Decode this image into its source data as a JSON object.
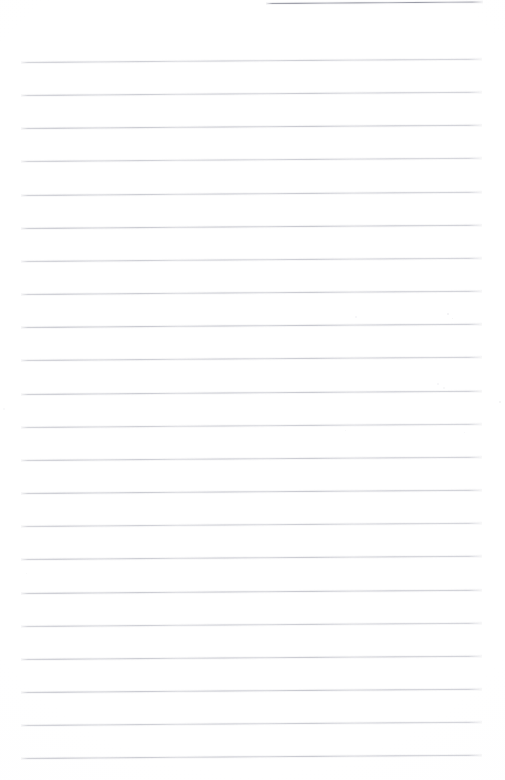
{
  "document": {
    "kind": "scanned-blank-ruled-paper",
    "page_label": "",
    "title": "",
    "body_text": "",
    "visible_text": "",
    "width_px": 505,
    "height_px": 780,
    "background_color": "#ffffff",
    "rule_color": "#babcc4",
    "top_fragment_color": "#8a8c98",
    "orientation": "portrait",
    "skew_degrees": -0.4
  },
  "ruling": {
    "line_count": 22,
    "spacing_px": 33.1,
    "first_line_y": 62,
    "left_margin_x": 21,
    "right_margin_x": 482,
    "line_thickness_px": 1,
    "lines": [
      {
        "y": 62,
        "x1": 21,
        "x2": 482
      },
      {
        "y": 95,
        "x1": 21,
        "x2": 482
      },
      {
        "y": 128,
        "x1": 21,
        "x2": 482
      },
      {
        "y": 161,
        "x1": 21,
        "x2": 482
      },
      {
        "y": 195,
        "x1": 21,
        "x2": 482
      },
      {
        "y": 228,
        "x1": 21,
        "x2": 482
      },
      {
        "y": 261,
        "x1": 21,
        "x2": 482
      },
      {
        "y": 294,
        "x1": 21,
        "x2": 482
      },
      {
        "y": 327,
        "x1": 21,
        "x2": 482
      },
      {
        "y": 360,
        "x1": 21,
        "x2": 482
      },
      {
        "y": 394,
        "x1": 21,
        "x2": 482
      },
      {
        "y": 427,
        "x1": 21,
        "x2": 482
      },
      {
        "y": 460,
        "x1": 21,
        "x2": 482
      },
      {
        "y": 493,
        "x1": 21,
        "x2": 482
      },
      {
        "y": 526,
        "x1": 21,
        "x2": 482
      },
      {
        "y": 559,
        "x1": 21,
        "x2": 482
      },
      {
        "y": 593,
        "x1": 21,
        "x2": 482
      },
      {
        "y": 626,
        "x1": 21,
        "x2": 482
      },
      {
        "y": 659,
        "x1": 21,
        "x2": 482
      },
      {
        "y": 692,
        "x1": 21,
        "x2": 482
      },
      {
        "y": 725,
        "x1": 21,
        "x2": 482
      },
      {
        "y": 758,
        "x1": 21,
        "x2": 482
      }
    ],
    "top_fragment": {
      "y": 3,
      "x1": 266,
      "x2": 483
    }
  },
  "artifacts": {
    "description": "faint scanner dust specks",
    "specks": [
      {
        "x": 355,
        "y": 316,
        "size": 2,
        "opacity": 0.35
      },
      {
        "x": 447,
        "y": 313,
        "size": 2,
        "opacity": 0.45
      },
      {
        "x": 452,
        "y": 318,
        "size": 1,
        "opacity": 0.4
      },
      {
        "x": 437,
        "y": 383,
        "size": 2,
        "opacity": 0.35
      },
      {
        "x": 443,
        "y": 387,
        "size": 2,
        "opacity": 0.3
      },
      {
        "x": 499,
        "y": 401,
        "size": 2,
        "opacity": 0.4
      },
      {
        "x": 345,
        "y": 430,
        "size": 1,
        "opacity": 0.3
      },
      {
        "x": 464,
        "y": 432,
        "size": 1,
        "opacity": 0.28
      },
      {
        "x": 3,
        "y": 408,
        "size": 2,
        "opacity": 0.25
      },
      {
        "x": 26,
        "y": 573,
        "size": 1,
        "opacity": 0.22
      }
    ]
  }
}
